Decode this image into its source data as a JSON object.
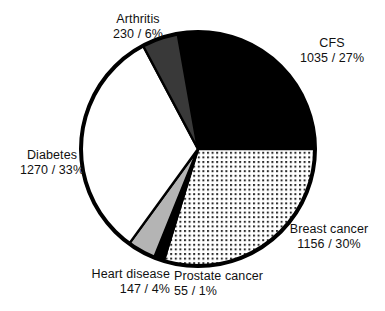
{
  "chart_data": {
    "type": "pie",
    "title": "",
    "subtitle": "",
    "xlabel": "",
    "ylabel": "",
    "legend_position": "none",
    "grid": false,
    "total": 3893,
    "categories": [
      "CFS",
      "Breast cancer",
      "Prostate cancer",
      "Heart disease",
      "Diabetes",
      "Arthritis"
    ],
    "values": [
      1035,
      1156,
      55,
      147,
      1270,
      230
    ],
    "percents": [
      27,
      30,
      1,
      4,
      33,
      6
    ],
    "slices": [
      {
        "name": "CFS",
        "value": 1035,
        "percent": 27,
        "label_name": "CFS",
        "label_value": "1035 / 27%",
        "fill_style": "solid-black",
        "fill_color": "#000000",
        "start_angle": -10,
        "end_angle": 90
      },
      {
        "name": "Breast cancer",
        "value": 1156,
        "percent": 30,
        "label_name": "Breast cancer",
        "label_value": "1156 / 30%",
        "fill_style": "dotted",
        "fill_color": "#ffffff",
        "start_angle": 90,
        "end_angle": 197
      },
      {
        "name": "Prostate cancer",
        "value": 55,
        "percent": 1,
        "label_name": "Prostate cancer",
        "label_value": "55 / 1%",
        "fill_style": "solid-black",
        "fill_color": "#000000",
        "start_angle": 197,
        "end_angle": 202
      },
      {
        "name": "Heart disease",
        "value": 147,
        "percent": 4,
        "label_name": "Heart disease",
        "label_value": "147 / 4%",
        "fill_style": "light-gray",
        "fill_color": "#b4b4b4",
        "start_angle": 202,
        "end_angle": 216
      },
      {
        "name": "Diabetes",
        "value": 1270,
        "percent": 33,
        "label_name": "Diabetes",
        "label_value": "1270 / 33%",
        "fill_style": "white",
        "fill_color": "#ffffff",
        "start_angle": 216,
        "end_angle": 332
      },
      {
        "name": "Arthritis",
        "value": 230,
        "percent": 6,
        "label_name": "Arthritis",
        "label_value": "230 / 6%",
        "fill_style": "dark-gray",
        "fill_color": "#393939",
        "start_angle": 332,
        "end_angle": 350
      }
    ],
    "geometry": {
      "center_x": 198,
      "center_y": 149,
      "radius": 117,
      "outline_color": "#000000",
      "outline_width": 4
    }
  }
}
